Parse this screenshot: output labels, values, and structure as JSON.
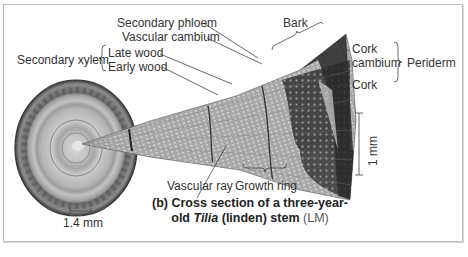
{
  "figure": {
    "caption_prefix": "(b) Cross section of a three-year-",
    "caption_line2_pre": "old ",
    "caption_italic": "Tilia",
    "caption_line2_post": " (linden) stem",
    "caption_method": "(LM)"
  },
  "labels": {
    "secondary_phloem": "Secondary phloem",
    "vascular_cambium": "Vascular cambium",
    "secondary_xylem": "Secondary xylem",
    "late_wood": "Late wood",
    "early_wood": "Early wood",
    "bark": "Bark",
    "cork_cambium_1": "Cork",
    "cork_cambium_2": "cambium",
    "periderm": "Periderm",
    "cork": "Cork",
    "vascular_ray": "Vascular ray",
    "growth_ring": "Growth ring"
  },
  "scale_bars": {
    "stem": "1.4 mm",
    "wedge": "1 mm"
  },
  "colors": {
    "frame_border": "#bdbdbd",
    "leader_line": "#444444",
    "wood_light": "#b8b8b8",
    "wood_dark": "#6e6e6e",
    "bark_dark": "#2e2e2e"
  }
}
